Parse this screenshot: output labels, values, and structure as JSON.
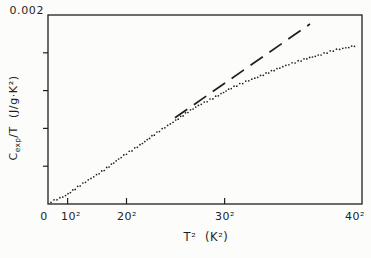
{
  "figure": {
    "y_axis_title": {
      "symbol": "C",
      "subscript": "exp",
      "rest": "/T  (J/g·K²)"
    },
    "x_axis_title": "T²  (K²)"
  },
  "colors": {
    "ink": "#1f1f1f",
    "background": "#fcfcfa"
  },
  "chart_data": {
    "type": "scatter",
    "title": "",
    "xlabel": "T² (K²)",
    "ylabel": "Cexp/T (J/g·K²)",
    "xlim": [
      0,
      1600
    ],
    "ylim": [
      0,
      0.002
    ],
    "grid": false,
    "legend": "none",
    "axis_style": {
      "frame": "closed-box",
      "x_ticks_direction": "in",
      "y_ticks_direction": "out"
    },
    "x_ticks": [
      {
        "value": 0,
        "label": "0"
      },
      {
        "value": 100,
        "label": "10²"
      },
      {
        "value": 400,
        "label": "20²"
      },
      {
        "value": 900,
        "label": "30²"
      },
      {
        "value": 1600,
        "label": "40²"
      }
    ],
    "y_ticks": [
      {
        "value": 0,
        "label": ""
      },
      {
        "value": 0.0004,
        "label": ""
      },
      {
        "value": 0.0008,
        "label": ""
      },
      {
        "value": 0.0012,
        "label": ""
      },
      {
        "value": 0.0016,
        "label": ""
      },
      {
        "value": 0.002,
        "label": "0.002"
      }
    ],
    "series": [
      {
        "name": "experimental-data",
        "style": "dotted",
        "points": [
          [
            15,
            2.4e-05
          ],
          [
            87,
            8.8e-05
          ],
          [
            163,
            0.000193
          ],
          [
            239,
            0.000299
          ],
          [
            316,
            0.000405
          ],
          [
            392,
            0.000521
          ],
          [
            469,
            0.000627
          ],
          [
            545,
            0.000737
          ],
          [
            622,
            0.000848
          ],
          [
            698,
            0.000954
          ],
          [
            774,
            0.001049
          ],
          [
            851,
            0.001133
          ],
          [
            927,
            0.001218
          ],
          [
            1004,
            0.001292
          ],
          [
            1080,
            0.001355
          ],
          [
            1157,
            0.001419
          ],
          [
            1233,
            0.001482
          ],
          [
            1309,
            0.001535
          ],
          [
            1386,
            0.001577
          ],
          [
            1462,
            0.00163
          ],
          [
            1539,
            0.001662
          ],
          [
            1574,
            0.001683
          ]
        ]
      },
      {
        "name": "linear-extrapolation",
        "style": "dashed",
        "points": [
          [
            647,
            0.000912
          ],
          [
            1335,
            0.001905
          ]
        ]
      }
    ]
  }
}
